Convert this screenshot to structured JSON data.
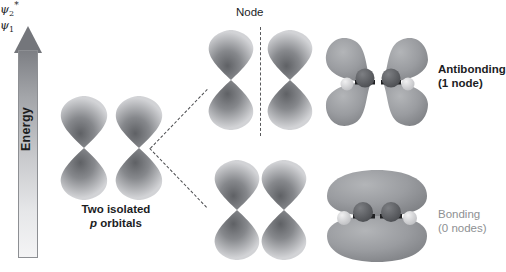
{
  "figure": {
    "type": "orbital-diagram",
    "background": "#ffffff"
  },
  "axis": {
    "label": "Energy",
    "direction": "up",
    "name": "energy-arrow"
  },
  "left_panel": {
    "caption_line1": "Two isolated",
    "caption_line2_italic": "p",
    "caption_line2_rest": " orbitals",
    "orbital_count": 2
  },
  "middle_panel": {
    "node_label": "Node",
    "upper": {
      "psi": "ψ",
      "subscript": "2",
      "superscript": "*",
      "has_node_line": true
    },
    "lower": {
      "psi": "ψ",
      "subscript": "1",
      "superscript": "",
      "has_node_line": false
    }
  },
  "right_panel": {
    "upper": {
      "label": "Antibonding",
      "sublabel": "(1 node)",
      "nodes": 1
    },
    "lower": {
      "label": "Bonding",
      "sublabel": "(0 nodes)",
      "nodes": 0
    }
  },
  "colors": {
    "orbital_light": "#c8c9cc",
    "orbital_mid": "#9b9da1",
    "orbital_dark": "#6e7074",
    "surface": "#9a9ca0",
    "atom_dark": "#5d5f63",
    "atom_light": "#d9dadc",
    "text": "#1c1d1f",
    "text_gray": "#8e9093",
    "dash": "#4a4b4e"
  }
}
